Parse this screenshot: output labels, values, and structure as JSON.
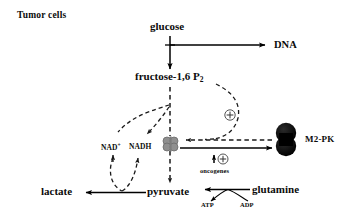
{
  "figure": {
    "title": "Tumor cells",
    "type": "metabolic-pathway-diagram",
    "background_color": "#ffffff",
    "line_color": "#000000",
    "tetramer_color": "#8a8a8a",
    "m2pk_color": "#000000"
  },
  "nodes": {
    "tumor_cells": "Tumor cells",
    "glucose": "glucose",
    "dna": "DNA",
    "fructose_name": "fructose-1,6 P",
    "fructose_sub": "2",
    "nad_name": "NAD",
    "nad_sup": "+",
    "nadh": "NADH",
    "lactate": "lactate",
    "pyruvate": "pyruvate",
    "glutamine": "glutamine",
    "atp": "ATP",
    "adp": "ADP",
    "oncogenes": "oncogenes",
    "m2pk": "M2-PK",
    "plus_activation": "+",
    "plus_oncogene": "+",
    "up_arrow": "↑"
  },
  "edges": [
    {
      "name": "glucose-to-fructose",
      "from": "glucose",
      "to": "fructose-1,6 P2",
      "style": "solid",
      "direction": "down"
    },
    {
      "name": "glucose-to-dna",
      "from": "glucose",
      "to": "DNA",
      "style": "solid",
      "direction": "right"
    },
    {
      "name": "fructose-to-pyruvate",
      "from": "fructose-1,6 P2",
      "to": "pyruvate",
      "style": "dashed",
      "direction": "down"
    },
    {
      "name": "fructose-to-m2pk-activation",
      "from": "fructose-1,6 P2",
      "to": "M2-PK tetramer",
      "style": "dashed",
      "direction": "curve-right-down",
      "modifier": "+"
    },
    {
      "name": "glycolysis-to-nad",
      "from": "glycolysis",
      "to": "NAD+",
      "style": "dashed",
      "direction": "curve-left"
    },
    {
      "name": "glycolysis-to-nadh",
      "from": "glycolysis",
      "to": "NADH",
      "style": "dashed",
      "direction": "curve-left-down"
    },
    {
      "name": "nad-redox-loop",
      "from": "NAD+/NADH",
      "to": "lactate-arrow",
      "style": "dashed",
      "direction": "down-loop"
    },
    {
      "name": "pyruvate-to-lactate",
      "from": "pyruvate",
      "to": "lactate",
      "style": "solid",
      "direction": "left"
    },
    {
      "name": "glutamine-to-pyruvate",
      "from": "glutamine",
      "to": "pyruvate",
      "style": "solid",
      "direction": "left"
    },
    {
      "name": "adp-to-atp",
      "from": "ADP",
      "to": "ATP",
      "style": "solid",
      "direction": "fork"
    },
    {
      "name": "tetramer-to-m2pk-dimer",
      "from": "tetramer",
      "to": "M2-PK",
      "style": "solid",
      "direction": "right"
    },
    {
      "name": "m2pk-dimer-to-tetramer",
      "from": "M2-PK",
      "to": "tetramer",
      "style": "dashed",
      "direction": "left"
    },
    {
      "name": "oncogenes-upregulation",
      "from": "oncogenes",
      "to": "M2-PK dimer",
      "style": "annotation",
      "modifier": "+"
    }
  ]
}
